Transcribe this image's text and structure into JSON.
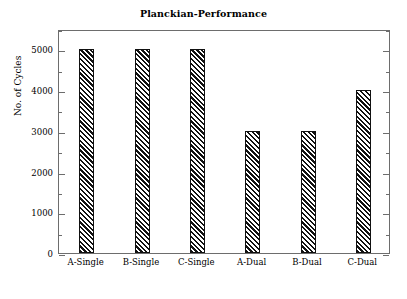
{
  "chart_data": {
    "type": "bar",
    "title": "Planckian-Performance",
    "xlabel": "",
    "ylabel": "No. of Cycles",
    "categories": [
      "A-Single",
      "B-Single",
      "C-Single",
      "A-Dual",
      "B-Dual",
      "C-Dual"
    ],
    "values": [
      5000,
      5000,
      5000,
      3000,
      3000,
      4000
    ],
    "ylim": [
      0,
      5500
    ],
    "ytick_labels": [
      "0",
      "1000",
      "2000",
      "3000",
      "4000",
      "5000"
    ],
    "ytick_values": [
      0,
      1000,
      2000,
      3000,
      4000,
      5000
    ],
    "yminor_step": 500,
    "grid": false,
    "legend": null,
    "bar_style": {
      "fill": "#ffffff",
      "hatch": "diagonal-lines",
      "edge_color": "#111111"
    },
    "axis_color": "#6d6d6d",
    "background": "#ffffff"
  }
}
